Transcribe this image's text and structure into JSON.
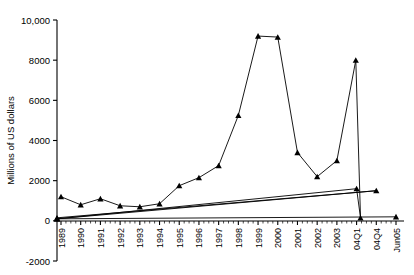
{
  "chart_data": {
    "type": "line",
    "title": "",
    "xlabel": "",
    "ylabel": "Millions of US dollars",
    "ylim": [
      -2000,
      10000
    ],
    "grid": false,
    "legend": "none",
    "ytick_labels": [
      "10,000",
      "8000",
      "6000",
      "4000",
      "2000",
      "0",
      "-2000"
    ],
    "ytick_values": [
      10000,
      8000,
      6000,
      4000,
      2000,
      0,
      -2000
    ],
    "categories": [
      "1989",
      "1990",
      "1991",
      "1992",
      "1993",
      "1994",
      "1995",
      "1996",
      "1997",
      "1998",
      "1999",
      "2000",
      "2001",
      "2002",
      "2003",
      "04Q1",
      "04Q4",
      "Jun05"
    ],
    "values": [
      1200,
      800,
      1100,
      750,
      700,
      850,
      1750,
      2150,
      2750,
      5250,
      9200,
      9150,
      3400,
      2200,
      3000,
      8000,
      150,
      150
    ],
    "series": [
      {
        "name": "Millions of US dollars",
        "points": [
          {
            "x": "1989",
            "y": 1200
          },
          {
            "x": "1990",
            "y": 800
          },
          {
            "x": "1991",
            "y": 1100
          },
          {
            "x": "1992",
            "y": 750
          },
          {
            "x": "1993",
            "y": 700
          },
          {
            "x": "1994",
            "y": 850
          },
          {
            "x": "1995",
            "y": 1750
          },
          {
            "x": "1996",
            "y": 2150
          },
          {
            "x": "1997",
            "y": 2750
          },
          {
            "x": "1998",
            "y": 5250
          },
          {
            "x": "1999",
            "y": 9200
          },
          {
            "x": "2000",
            "y": 9150
          },
          {
            "x": "2001",
            "y": 3400
          },
          {
            "x": "2002",
            "y": 2200
          },
          {
            "x": "2003",
            "y": 3000
          },
          {
            "x": "2003.4",
            "y": 8000
          },
          {
            "x": "2003.5",
            "y": 150
          },
          {
            "x": "04Q1",
            "y": 1600
          },
          {
            "x": "04Q2",
            "y": 100
          },
          {
            "x": "04Q3",
            "y": 150
          },
          {
            "x": "04Q4",
            "y": 1500
          },
          {
            "x": "05Q1",
            "y": 100
          },
          {
            "x": "Jun05",
            "y": 200
          }
        ]
      }
    ]
  }
}
